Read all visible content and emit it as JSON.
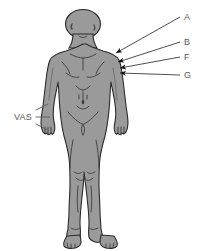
{
  "figure": {
    "type": "anatomical-diagram",
    "background_color": "#ffffff",
    "body_fill_color": "#9a9a9a",
    "body_outline_color": "#2b2b2b",
    "label_color": "#5a5a5a",
    "leader_line_color": "#3a3a3a"
  },
  "labels": {
    "right_side": [
      {
        "id": "A",
        "text": "A",
        "x": 184,
        "y": 13,
        "arrow_tip": {
          "x": 115,
          "y": 53
        }
      },
      {
        "id": "B",
        "text": "B",
        "x": 184,
        "y": 38,
        "arrow_tip": {
          "x": 117,
          "y": 62
        }
      },
      {
        "id": "F",
        "text": "F",
        "x": 184,
        "y": 53,
        "arrow_tip": {
          "x": 119,
          "y": 68
        }
      },
      {
        "id": "G",
        "text": "G",
        "x": 184,
        "y": 71,
        "arrow_tip": {
          "x": 119,
          "y": 73
        }
      }
    ],
    "left_side": [
      {
        "id": "VAS",
        "text": "VAS",
        "x": 14,
        "y": 113,
        "leader_lines": 3
      }
    ]
  }
}
